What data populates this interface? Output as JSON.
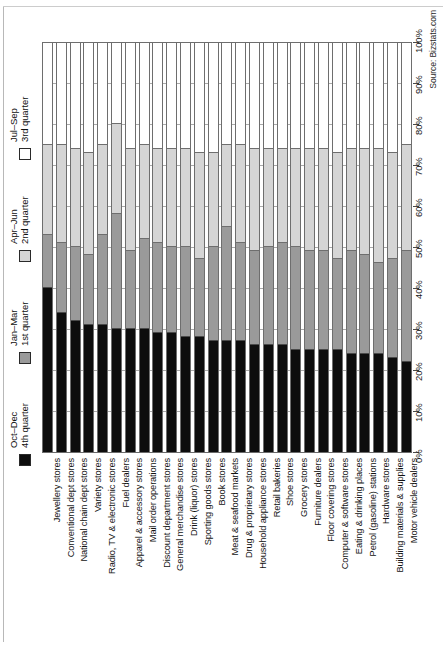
{
  "source_note": "Source: Bizstats.com",
  "legend": {
    "items": [
      {
        "id": "q1",
        "line1": "1st quarter",
        "line2": "Jan–Mar",
        "color": "#9a9a9a"
      },
      {
        "id": "q2",
        "line1": "2nd quarter",
        "line2": "Apr–Jun",
        "color": "#d5d5d5"
      },
      {
        "id": "q3",
        "line1": "3rd quarter",
        "line2": "Jul–Sep",
        "color": "#ffffff"
      },
      {
        "id": "q4",
        "line1": "4th quarter",
        "line2": "Oct–Dec",
        "color": "#0d0d0d"
      }
    ]
  },
  "axis": {
    "ticks": [
      "0%",
      "10%",
      "20%",
      "30%",
      "40%",
      "50%",
      "60%",
      "70%",
      "80%",
      "90%",
      "100%"
    ]
  },
  "chart_data": {
    "type": "bar",
    "subtype": "stacked-bar-100-percent",
    "title": "",
    "xlabel": "",
    "ylabel": "",
    "ylim": [
      0,
      100
    ],
    "grid": true,
    "legend_position": "left-rotated",
    "source": "Source: Bizstats.com",
    "tick_labels": [
      "0%",
      "10%",
      "20%",
      "30%",
      "40%",
      "50%",
      "60%",
      "70%",
      "80%",
      "90%",
      "100%"
    ],
    "categories": [
      "Jewellery stores",
      "Conventional dept stores",
      "National chain dept stores",
      "Variety stores",
      "Radio, TV & electronic stores",
      "Fuel dealers",
      "Apparel & accessory stores",
      "Mail order operations",
      "Discount department stores",
      "General merchandise stores",
      "Drink (liquor) stores",
      "Sporting goods stores",
      "Book stores",
      "Meat & seafood markets",
      "Drug & proprietary stores",
      "Household appliance stores",
      "Retail bakeries",
      "Shoe stores",
      "Grocery stores",
      "Furniture dealers",
      "Floor covering stores",
      "Computer & software stores",
      "Eating & drinking places",
      "Petrol (gasoline) stations",
      "Hardware stores",
      "Building materials & supplies",
      "Motor vehicle dealers"
    ],
    "series": [
      {
        "name": "4th quarter Oct–Dec",
        "key": "q4",
        "color": "#0d0d0d",
        "values": [
          40,
          34,
          32,
          31,
          31,
          30,
          30,
          30,
          29,
          29,
          28,
          28,
          27,
          27,
          27,
          26,
          26,
          26,
          25,
          25,
          25,
          25,
          24,
          24,
          24,
          23,
          22
        ]
      },
      {
        "name": "1st quarter Jan–Mar",
        "key": "q1",
        "color": "#9a9a9a",
        "values": [
          13,
          17,
          18,
          17,
          22,
          28,
          19,
          22,
          22,
          21,
          22,
          19,
          23,
          28,
          24,
          23,
          24,
          25,
          25,
          24,
          24,
          22,
          25,
          24,
          22,
          24,
          27
        ]
      },
      {
        "name": "2nd quarter Apr–Jun",
        "key": "q2",
        "color": "#d5d5d5",
        "values": [
          22,
          24,
          24,
          25,
          22,
          22,
          25,
          23,
          23,
          24,
          24,
          26,
          23,
          20,
          24,
          25,
          24,
          23,
          24,
          25,
          25,
          26,
          25,
          26,
          28,
          26,
          26
        ]
      },
      {
        "name": "3rd quarter Jul–Sep",
        "key": "q3",
        "color": "#ffffff",
        "values": [
          25,
          25,
          26,
          27,
          25,
          20,
          26,
          25,
          26,
          26,
          26,
          27,
          27,
          25,
          25,
          26,
          26,
          26,
          26,
          26,
          26,
          27,
          26,
          26,
          26,
          27,
          25
        ]
      }
    ]
  }
}
